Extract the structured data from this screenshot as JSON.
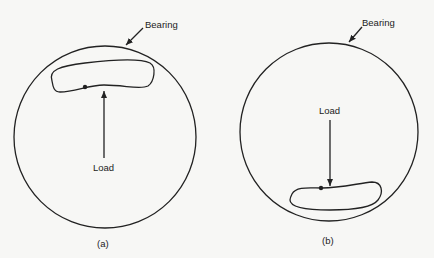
{
  "figure": {
    "panel_a": {
      "caption": "(a)",
      "bearing_label": "Bearing",
      "load_label": "Load",
      "load_direction": "up"
    },
    "panel_b": {
      "caption": "(b)",
      "bearing_label": "Bearing",
      "load_label": "Load",
      "load_direction": "down"
    }
  },
  "colors": {
    "line": "#222222",
    "background": "#f7f7f5"
  }
}
